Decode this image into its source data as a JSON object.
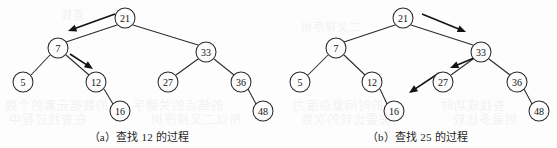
{
  "page": {
    "background_color": "#fdfdfd",
    "ink_color": "#2a2a2a",
    "width": 557,
    "height": 148
  },
  "figures": [
    {
      "id": "figure-a",
      "caption": "（a）查找 12 的过程",
      "search_key": "12",
      "nodes": [
        {
          "label": "21",
          "cx": 125,
          "cy": 18,
          "r": 10,
          "name": "node-21"
        },
        {
          "label": "7",
          "cx": 58,
          "cy": 48,
          "r": 10,
          "name": "node-7"
        },
        {
          "label": "33",
          "cx": 206,
          "cy": 52,
          "r": 10,
          "name": "node-33"
        },
        {
          "label": "5",
          "cx": 23,
          "cy": 82,
          "r": 10,
          "name": "node-5"
        },
        {
          "label": "12",
          "cx": 96,
          "cy": 82,
          "r": 10,
          "name": "node-12"
        },
        {
          "label": "27",
          "cx": 168,
          "cy": 82,
          "r": 10,
          "name": "node-27"
        },
        {
          "label": "36",
          "cx": 241,
          "cy": 82,
          "r": 10,
          "name": "node-36"
        },
        {
          "label": "16",
          "cx": 120,
          "cy": 111,
          "r": 10,
          "name": "node-16"
        },
        {
          "label": "48",
          "cx": 263,
          "cy": 111,
          "r": 10,
          "name": "node-48"
        }
      ],
      "edges": [
        {
          "from": "21",
          "to": "7",
          "x1": 117,
          "y1": 25,
          "x2": 66,
          "y2": 42
        },
        {
          "from": "21",
          "to": "33",
          "x1": 133,
          "y1": 25,
          "x2": 198,
          "y2": 45
        },
        {
          "from": "7",
          "to": "5",
          "x1": 50,
          "y1": 55,
          "x2": 31,
          "y2": 75
        },
        {
          "from": "7",
          "to": "12",
          "x1": 66,
          "y1": 55,
          "x2": 89,
          "y2": 75
        },
        {
          "from": "12",
          "to": "16",
          "x1": 104,
          "y1": 89,
          "x2": 113,
          "y2": 104
        },
        {
          "from": "33",
          "to": "27",
          "x1": 198,
          "y1": 59,
          "x2": 176,
          "y2": 75
        },
        {
          "from": "33",
          "to": "36",
          "x1": 214,
          "y1": 59,
          "x2": 234,
          "y2": 75
        },
        {
          "from": "36",
          "to": "48",
          "x1": 248,
          "y1": 89,
          "x2": 256,
          "y2": 104
        }
      ],
      "search_arrows": [
        {
          "step": 1,
          "from_node": "21",
          "to_node": "7",
          "x1": 115,
          "y1": 14,
          "x2": 68,
          "y2": 31
        },
        {
          "step": 2,
          "from_node": "7",
          "to_node": "12",
          "x1": 70,
          "y1": 54,
          "x2": 93,
          "y2": 69
        }
      ]
    },
    {
      "id": "figure-b",
      "caption": "（b）查找 25 的过程",
      "search_key": "25",
      "nodes": [
        {
          "label": "21",
          "cx": 125,
          "cy": 18,
          "r": 10,
          "name": "node-21"
        },
        {
          "label": "7",
          "cx": 58,
          "cy": 48,
          "r": 10,
          "name": "node-7"
        },
        {
          "label": "33",
          "cx": 203,
          "cy": 52,
          "r": 10,
          "name": "node-33"
        },
        {
          "label": "5",
          "cx": 22,
          "cy": 82,
          "r": 10,
          "name": "node-5"
        },
        {
          "label": "12",
          "cx": 94,
          "cy": 82,
          "r": 10,
          "name": "node-12"
        },
        {
          "label": "27",
          "cx": 165,
          "cy": 82,
          "r": 10,
          "name": "node-27"
        },
        {
          "label": "36",
          "cx": 239,
          "cy": 82,
          "r": 10,
          "name": "node-36"
        },
        {
          "label": "16",
          "cx": 116,
          "cy": 111,
          "r": 10,
          "name": "node-16"
        },
        {
          "label": "48",
          "cx": 261,
          "cy": 111,
          "r": 10,
          "name": "node-48"
        }
      ],
      "edges": [
        {
          "from": "21",
          "to": "7",
          "x1": 117,
          "y1": 25,
          "x2": 66,
          "y2": 42
        },
        {
          "from": "21",
          "to": "33",
          "x1": 133,
          "y1": 25,
          "x2": 195,
          "y2": 45
        },
        {
          "from": "7",
          "to": "5",
          "x1": 50,
          "y1": 55,
          "x2": 30,
          "y2": 75
        },
        {
          "from": "7",
          "to": "12",
          "x1": 66,
          "y1": 55,
          "x2": 87,
          "y2": 75
        },
        {
          "from": "12",
          "to": "16",
          "x1": 102,
          "y1": 89,
          "x2": 109,
          "y2": 104
        },
        {
          "from": "33",
          "to": "27",
          "x1": 195,
          "y1": 59,
          "x2": 173,
          "y2": 75
        },
        {
          "from": "33",
          "to": "36",
          "x1": 211,
          "y1": 59,
          "x2": 232,
          "y2": 75
        },
        {
          "from": "36",
          "to": "48",
          "x1": 246,
          "y1": 89,
          "x2": 254,
          "y2": 104
        }
      ],
      "search_arrows": [
        {
          "step": 1,
          "from_node": "21",
          "to_node": "33",
          "x1": 144,
          "y1": 14,
          "x2": 188,
          "y2": 32
        },
        {
          "step": 2,
          "from_node": "33",
          "to_node": "27",
          "x1": 196,
          "y1": 58,
          "x2": 172,
          "y2": 68
        },
        {
          "step": 3,
          "from_node": "27",
          "to_node": "null",
          "x1": 161,
          "y1": 73,
          "x2": 131,
          "y2": 93
        }
      ]
    }
  ],
  "bleed_text": [
    {
      "text": "的数据元素的个数",
      "left": 4,
      "top": 96,
      "size": 12
    },
    {
      "text": "的结点的关键字",
      "left": 132,
      "top": 96,
      "size": 12
    },
    {
      "text": "在查找过程中",
      "left": 8,
      "top": 110,
      "size": 12
    },
    {
      "text": "所以二叉排序树",
      "left": 150,
      "top": 110,
      "size": 12
    },
    {
      "text": "的时间复杂度为",
      "left": 292,
      "top": 96,
      "size": 12
    },
    {
      "text": "查找成功时",
      "left": 440,
      "top": 96,
      "size": 12
    },
    {
      "text": "需要比较的次数",
      "left": 300,
      "top": 110,
      "size": 12
    },
    {
      "text": "则最多比较",
      "left": 452,
      "top": 110,
      "size": 12
    },
    {
      "text": "二叉排序树",
      "left": 300,
      "top": 18,
      "size": 11
    },
    {
      "text": "查找",
      "left": 60,
      "top": 6,
      "size": 11
    }
  ]
}
